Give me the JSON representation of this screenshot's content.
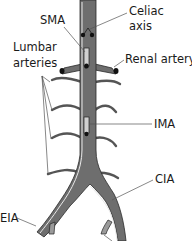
{
  "diagram": {
    "labels": {
      "celiac_line1": "Celiac",
      "celiac_line2": "axis",
      "sma": "SMA",
      "lumbar_line1": "Lumbar",
      "lumbar_line2": "arteries",
      "renal": "Renal artery",
      "ima": "IMA",
      "cia": "CIA",
      "eia": "EIA"
    },
    "colors": {
      "vessel_fill": "#6e6e6e",
      "vessel_outline": "#2a2a2a",
      "highlight": "#e8e8e8",
      "ostium": "#111111",
      "text": "#1a1a1a",
      "background": "#ffffff"
    }
  }
}
